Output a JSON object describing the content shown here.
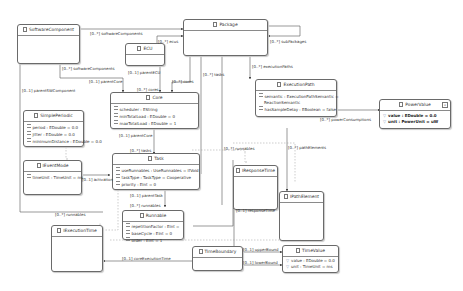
{
  "classes": {
    "software_component": {
      "name": "SoftwareComponent",
      "attrs": []
    },
    "package": {
      "name": "Package",
      "attrs": []
    },
    "ecu": {
      "name": "ECU",
      "attrs": []
    },
    "core": {
      "name": "Core",
      "attrs": [
        "scheduler : EString",
        "minTotalLoad : EDouble = 0",
        "maxTotalLoad : EDouble = 1"
      ]
    },
    "simple_periodic": {
      "name": "SimplePeriodic",
      "attrs": [
        "period : EDouble = 0.0",
        "jitter : EDouble = 0.0",
        "minimumDistance : EDouble = 0.0"
      ]
    },
    "execution_path": {
      "name": "ExecutionPath",
      "attrs": [
        "semantic : ExecutionPathSemantic =",
        "ReactionSemantic",
        "hasSampleDelay : EBoolean = false"
      ]
    },
    "power_value": {
      "name": "PowerValue",
      "attrs": [
        "value : EDouble = 0.0",
        "unit : PowerUnit = uW"
      ]
    },
    "event_mode": {
      "name": "IEventMode",
      "attrs": [
        "timeUnit : TimeUnit = ms"
      ]
    },
    "task": {
      "name": "Task",
      "attrs": [
        "useRunnables : UseRunnables = IfVoid",
        "taskType : TaskType = Cooperative",
        "priority : EInt = 0"
      ]
    },
    "response_time": {
      "name": "IResponseTime",
      "attrs": []
    },
    "path_element": {
      "name": "IPathElement",
      "attrs": []
    },
    "runnable": {
      "name": "Runnable",
      "attrs": [
        "repetitionFactor : EInt =",
        "baseCycle : EInt = 0",
        "order : EInt = 1"
      ]
    },
    "execution_time": {
      "name": "IExecutionTime",
      "attrs": []
    },
    "time_boundary": {
      "name": "TimeBoundary",
      "attrs": []
    },
    "time_value": {
      "name": "TimeValue",
      "attrs": [
        "value : EDouble = 0.0",
        "unit : TimeUnit = ms"
      ]
    }
  },
  "edge_labels": {
    "software_components_top": "[0..*] softwareComponents",
    "ecus": "[0..*] ecus",
    "sub_packages": "[0..*] subPackages",
    "software_components_core": "[0..*] softwareComponents",
    "parent_core_sw": "[0..1] parentCore",
    "parent_ecu": "[0..1] parentECU",
    "cores_ecu": "[0..*] cores",
    "cores_pkg": "[0..*] cores",
    "tasks_pkg": "[0..*] tasks",
    "execution_paths": "[0..*] executionPaths",
    "parent_sw_component": "[0..1] parentSWComponent",
    "power_consumptions": "[0..*] powerConsumptions",
    "parent_core_task": "[0..1] parentCore",
    "tasks_core": "[0..*] tasks",
    "runnables_pkg": "[0..*] runnables",
    "path_elements": "[0..*] pathElements",
    "activation": "[0..1] activation",
    "parent_task": "[0..1] parentTask",
    "runnables_task": "[0..*] runnables",
    "response_time": "[0..1] responseTime",
    "runnables_sw": "[0..*] runnables",
    "upper_bound": "[0..1] upperBound",
    "lower_bound": "[0..1] lowerBound",
    "core_execution_time": "[0..1] coreExecutionTime"
  },
  "colors": {
    "border": "#6a6a6a",
    "edge": "#555555",
    "text": "#333333",
    "background": "#ffffff"
  }
}
